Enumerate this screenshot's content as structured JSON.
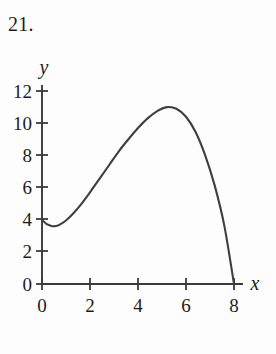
{
  "figure": {
    "problem_number": "21.",
    "background_color": "#fdfdfd",
    "ink_color": "#3a3a3a"
  },
  "chart_data": {
    "type": "line",
    "title": "",
    "subtitle": "",
    "xlabel": "x",
    "ylabel": "y",
    "xlim": [
      0,
      8.4
    ],
    "ylim": [
      0,
      12.4
    ],
    "xticks": [
      0,
      2,
      4,
      6,
      8
    ],
    "yticks": [
      0,
      2,
      4,
      6,
      8,
      10,
      12
    ],
    "xtick_labels": [
      "0",
      "2",
      "4",
      "6",
      "8"
    ],
    "ytick_labels": [
      "0",
      "2",
      "4",
      "6",
      "8",
      "10",
      "12"
    ],
    "grid": false,
    "legend": null,
    "legend_position": "none",
    "annotations": [],
    "series": [
      {
        "name": "curve",
        "color": "#3f3f3f",
        "x": [
          0.0,
          0.2,
          0.4,
          0.55,
          0.7,
          1.0,
          1.3,
          1.6,
          2.0,
          2.4,
          2.8,
          3.2,
          3.6,
          4.0,
          4.4,
          4.8,
          5.2,
          5.6,
          6.0,
          6.4,
          6.8,
          7.2,
          7.6,
          8.0
        ],
        "y": [
          4.0,
          3.72,
          3.61,
          3.6,
          3.66,
          3.95,
          4.38,
          4.9,
          5.7,
          6.55,
          7.4,
          8.25,
          9.0,
          9.7,
          10.3,
          10.75,
          11.0,
          10.9,
          10.4,
          9.45,
          8.0,
          6.1,
          3.6,
          0.0
        ]
      }
    ],
    "key_points": {
      "y_intercept": 4.0,
      "local_minimum": {
        "x": 0.55,
        "y": 3.6
      },
      "maximum": {
        "x": 5.2,
        "y": 11.0
      },
      "x_intercept": {
        "x": 8.0,
        "y": 0.0
      }
    }
  }
}
